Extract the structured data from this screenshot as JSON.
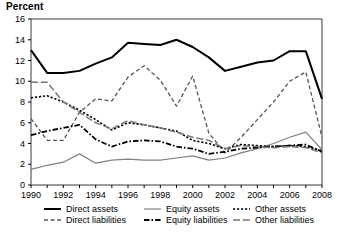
{
  "chart_data": {
    "type": "line",
    "title": "Percent",
    "xlabel": "",
    "ylabel": "Percent",
    "xlim": [
      1990,
      2008
    ],
    "ylim": [
      0,
      16
    ],
    "yticks": [
      0,
      2,
      4,
      6,
      8,
      10,
      12,
      14,
      16
    ],
    "xticks": [
      1990,
      1991,
      1992,
      1993,
      1994,
      1995,
      1996,
      1997,
      1998,
      1999,
      2000,
      2001,
      2002,
      2003,
      2004,
      2005,
      2006,
      2007,
      2008
    ],
    "xtick_labels": [
      "1990",
      "",
      "1992",
      "",
      "1994",
      "",
      "1996",
      "",
      "1998",
      "",
      "2000",
      "",
      "2002",
      "",
      "2004",
      "",
      "2006",
      "",
      "2008"
    ],
    "grid": false,
    "legend_position": "below",
    "x": [
      1990,
      1991,
      1992,
      1993,
      1994,
      1995,
      1996,
      1997,
      1998,
      1999,
      2000,
      2001,
      2002,
      2003,
      2004,
      2005,
      2006,
      2007,
      2008
    ],
    "series": [
      {
        "name": "Direct assets",
        "style": "solid",
        "color": "#000000",
        "width": 2.0,
        "values": [
          13.0,
          10.8,
          10.8,
          11.0,
          11.7,
          12.3,
          13.7,
          13.6,
          13.5,
          14.0,
          13.3,
          12.3,
          11.0,
          11.4,
          11.8,
          12.0,
          12.9,
          12.9,
          8.3
        ]
      },
      {
        "name": "Direct liabilities",
        "style": "dashed",
        "color": "#555555",
        "width": 1.3,
        "values": [
          6.4,
          4.3,
          4.3,
          7.0,
          8.3,
          8.1,
          10.4,
          11.5,
          10.1,
          7.6,
          10.5,
          5.0,
          3.1,
          4.6,
          6.3,
          8.0,
          10.0,
          10.9,
          4.6
        ]
      },
      {
        "name": "Equity assets",
        "style": "solid",
        "color": "#808080",
        "width": 1.2,
        "values": [
          1.5,
          1.9,
          2.2,
          3.0,
          2.1,
          2.4,
          2.5,
          2.4,
          2.4,
          2.6,
          2.8,
          2.4,
          2.6,
          3.1,
          3.5,
          4.0,
          4.6,
          5.1,
          3.4
        ]
      },
      {
        "name": "Equity liabilities",
        "style": "dashdot",
        "color": "#000000",
        "width": 1.8,
        "values": [
          4.8,
          5.2,
          5.5,
          5.8,
          4.4,
          3.7,
          4.2,
          4.3,
          4.2,
          3.7,
          3.5,
          3.0,
          3.2,
          3.5,
          3.6,
          3.7,
          3.8,
          3.9,
          3.2
        ]
      },
      {
        "name": "Other assets",
        "style": "dotted",
        "color": "#000000",
        "width": 1.6,
        "values": [
          8.4,
          8.6,
          8.0,
          7.2,
          6.3,
          5.3,
          6.0,
          5.8,
          5.5,
          5.2,
          4.3,
          4.0,
          3.5,
          3.9,
          3.8,
          3.7,
          3.8,
          3.7,
          3.3
        ]
      },
      {
        "name": "Other liabilities",
        "style": "longdash",
        "color": "#777777",
        "width": 1.5,
        "values": [
          9.9,
          9.9,
          8.0,
          7.0,
          6.0,
          5.4,
          6.2,
          5.8,
          5.5,
          5.1,
          4.6,
          4.3,
          3.5,
          3.8,
          3.7,
          3.6,
          3.7,
          3.6,
          3.1
        ]
      }
    ]
  },
  "legend": {
    "entries": [
      {
        "label": "Direct assets"
      },
      {
        "label": "Equity assets"
      },
      {
        "label": "Other assets"
      },
      {
        "label": "Direct liabilities"
      },
      {
        "label": "Equity liabilities"
      },
      {
        "label": "Other liabilities"
      }
    ]
  }
}
